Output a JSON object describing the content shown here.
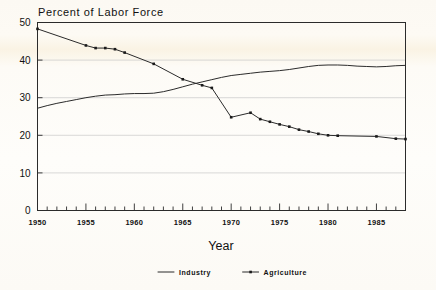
{
  "chart_data": {
    "type": "line",
    "title": "Percent of Labor Force",
    "xlabel": "Year",
    "ylabel": "",
    "xlim": [
      1950,
      1988
    ],
    "ylim": [
      0,
      50
    ],
    "yticks": [
      0,
      10,
      20,
      30,
      40,
      50
    ],
    "xticks": [
      1950,
      1955,
      1960,
      1965,
      1970,
      1975,
      1980,
      1985
    ],
    "xminor_step": 1,
    "grid": "horizontal",
    "legend_position": "bottom",
    "series": [
      {
        "name": "Industry",
        "markers": false,
        "x": [
          1950,
          1951,
          1952,
          1953,
          1954,
          1955,
          1956,
          1957,
          1958,
          1959,
          1960,
          1961,
          1962,
          1963,
          1964,
          1965,
          1966,
          1967,
          1968,
          1969,
          1970,
          1971,
          1972,
          1973,
          1974,
          1975,
          1976,
          1977,
          1978,
          1979,
          1980,
          1981,
          1982,
          1983,
          1984,
          1985,
          1986,
          1987,
          1988
        ],
        "values": [
          27.2,
          27.9,
          28.5,
          29.0,
          29.5,
          30.0,
          30.4,
          30.7,
          30.8,
          31.0,
          31.1,
          31.1,
          31.2,
          31.6,
          32.2,
          32.9,
          33.6,
          34.2,
          34.8,
          35.4,
          35.9,
          36.2,
          36.5,
          36.8,
          37.0,
          37.2,
          37.5,
          37.9,
          38.3,
          38.6,
          38.7,
          38.7,
          38.6,
          38.4,
          38.3,
          38.2,
          38.3,
          38.5,
          38.6
        ]
      },
      {
        "name": "Agriculture",
        "markers": true,
        "x": [
          1950,
          1955,
          1956,
          1957,
          1958,
          1959,
          1962,
          1965,
          1967,
          1968,
          1970,
          1972,
          1973,
          1974,
          1975,
          1976,
          1977,
          1978,
          1979,
          1980,
          1981,
          1985,
          1987,
          1988
        ],
        "values": [
          48.3,
          43.9,
          43.2,
          43.2,
          42.9,
          42.0,
          39.0,
          34.9,
          33.3,
          32.6,
          24.8,
          26.0,
          24.3,
          23.6,
          22.9,
          22.3,
          21.5,
          21.0,
          20.4,
          20.0,
          19.9,
          19.7,
          19.1,
          19.0
        ]
      }
    ],
    "legend": [
      {
        "label": "Industry",
        "marker": "line"
      },
      {
        "label": "Agriculture",
        "marker": "line-with-points"
      }
    ]
  },
  "colors": {
    "ink": "#2b2b2b",
    "grid": "#c9c9c9",
    "paper": "#fdfcfa"
  }
}
